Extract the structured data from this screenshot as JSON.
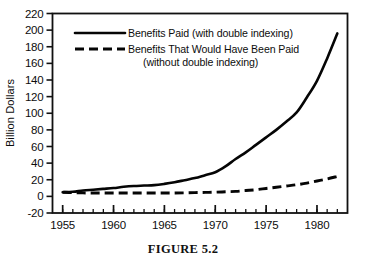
{
  "figure": {
    "caption": "FIGURE 5.2"
  },
  "chart_data": {
    "type": "line",
    "title": "",
    "xlabel": "",
    "ylabel": "Billion Dollars",
    "xlim": [
      1954,
      1983
    ],
    "ylim": [
      -20,
      220
    ],
    "ytick_step": 20,
    "grid": false,
    "legend_position": "upper-left-inside",
    "x_tick_labels": [
      "1955",
      "1960",
      "1965",
      "1970",
      "1975",
      "1980"
    ],
    "x_tick_values": [
      1955,
      1960,
      1965,
      1970,
      1975,
      1980
    ],
    "x_minor_ticks_every_year": true,
    "y_tick_labels": [
      "220",
      "200",
      "180",
      "160",
      "140",
      "120",
      "100",
      "80",
      "60",
      "40",
      "20",
      "0",
      "-20"
    ],
    "y_tick_values": [
      220,
      200,
      180,
      160,
      140,
      120,
      100,
      80,
      60,
      40,
      20,
      0,
      -20
    ],
    "series": [
      {
        "name": "Benefits Paid (with double indexing)",
        "style": "solid",
        "color": "#050505",
        "x": [
          1955,
          1956,
          1957,
          1958,
          1959,
          1960,
          1961,
          1962,
          1963,
          1964,
          1965,
          1966,
          1967,
          1968,
          1969,
          1970,
          1971,
          1972,
          1973,
          1974,
          1975,
          1976,
          1977,
          1978,
          1979,
          1980,
          1981,
          1982
        ],
        "values": [
          5,
          5.5,
          7,
          8,
          9,
          10,
          11.5,
          12.5,
          13,
          13.5,
          15,
          17,
          19.5,
          22,
          25.5,
          29,
          36,
          45,
          53,
          62,
          71,
          80,
          90,
          101,
          119,
          139,
          166,
          196
        ]
      },
      {
        "name": "Benefits That Would Have Been Paid (without double indexing)",
        "style": "dashed",
        "color": "#050505",
        "x": [
          1955,
          1956,
          1957,
          1958,
          1959,
          1960,
          1961,
          1962,
          1963,
          1964,
          1965,
          1966,
          1967,
          1968,
          1969,
          1970,
          1971,
          1972,
          1973,
          1974,
          1975,
          1976,
          1977,
          1978,
          1979,
          1980,
          1981,
          1982
        ],
        "values": [
          5,
          4.5,
          4.2,
          4,
          4,
          4,
          4,
          4,
          4,
          4,
          4,
          4,
          4.2,
          4.5,
          4.8,
          5,
          5.5,
          6,
          7,
          8,
          9.5,
          11,
          12.5,
          14,
          16,
          18.5,
          21,
          24
        ]
      }
    ]
  },
  "legend": {
    "entries": [
      {
        "label_line1": "Benefits Paid (with double indexing)",
        "label_line2": "",
        "style": "solid"
      },
      {
        "label_line1": "Benefits That Would Have Been Paid",
        "label_line2": "(without double indexing)",
        "style": "dashed"
      }
    ]
  }
}
